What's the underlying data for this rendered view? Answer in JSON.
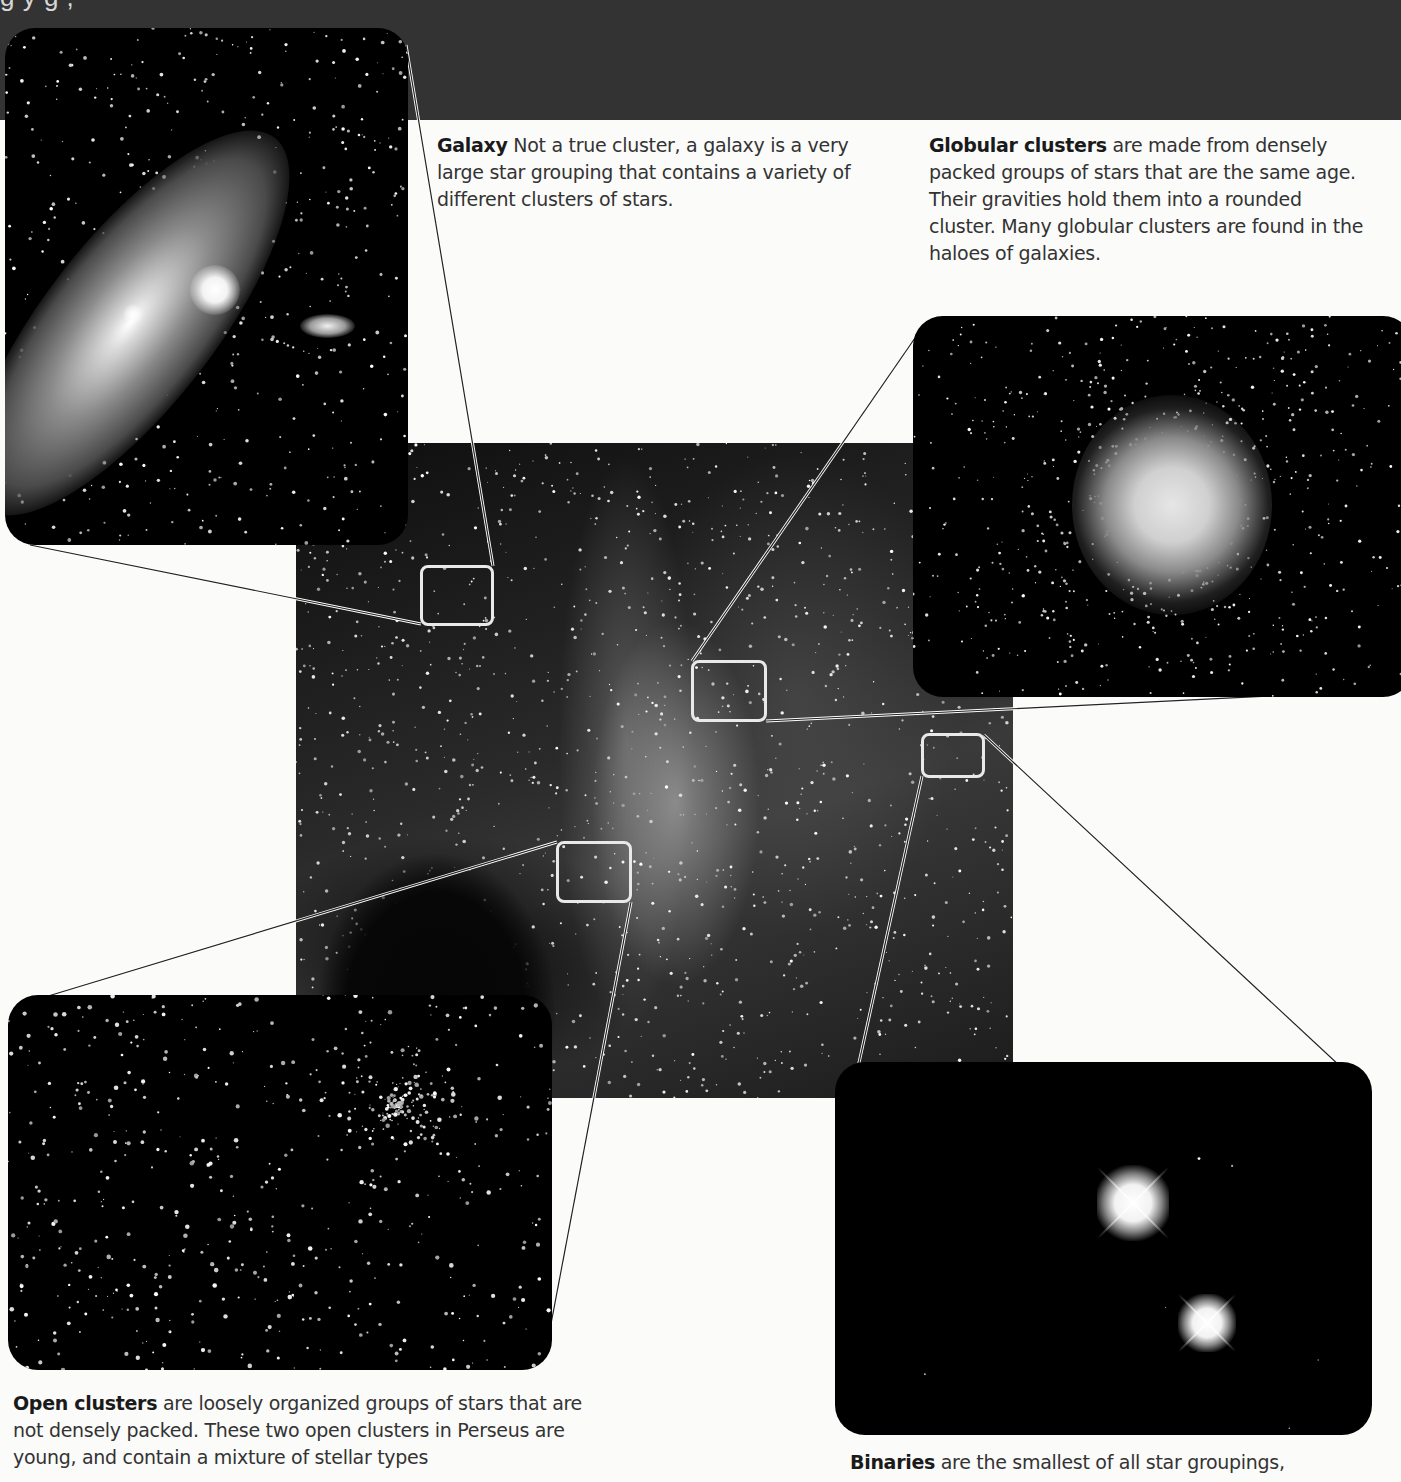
{
  "page": {
    "top_band_cut_title": "g                y            g          ,",
    "background": "#fbfbfa",
    "band_color": "#333333"
  },
  "captions": {
    "galaxy": {
      "term": "Galaxy",
      "text": "  Not a true cluster, a galaxy is a very large star grouping that contains a variety of different clusters of stars."
    },
    "globular": {
      "term": "Globular clusters",
      "text": " are made from densely packed groups of stars that are the same age. Their gravities hold them into a rounded cluster. Many globular clusters are found in the haloes of galaxies."
    },
    "open": {
      "term": "Open clusters",
      "text": " are loosely organized groups of stars that are not densely packed. These two open clusters in Perseus are young, and contain a mixture of stellar types"
    },
    "binary": {
      "term": "Binaries",
      "text": " are the smallest of all star groupings,"
    }
  },
  "images": {
    "central": "milky-way-photo",
    "galaxy_panel": "andromeda-galaxy-photo",
    "globular_panel": "globular-cluster-photo",
    "open_panel": "perseus-double-cluster-photo",
    "binary_panel": "binary-star-photo"
  }
}
